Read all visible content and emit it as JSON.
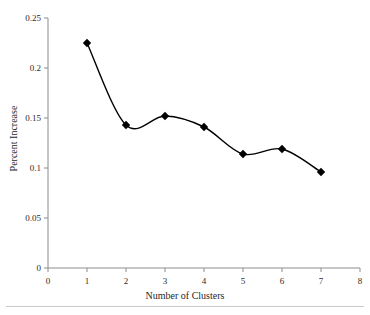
{
  "chart_data": {
    "type": "line",
    "title": "",
    "subtitle": "",
    "xlabel": "Number of Clusters",
    "ylabel": "Percent Increase",
    "x": [
      1,
      2,
      3,
      4,
      5,
      6,
      7
    ],
    "values": [
      0.225,
      0.143,
      0.152,
      0.141,
      0.114,
      0.119,
      0.096
    ],
    "series": [
      {
        "name": "Percent Increase",
        "values": [
          0.225,
          0.143,
          0.152,
          0.141,
          0.114,
          0.119,
          0.096
        ]
      }
    ],
    "xlim": [
      0,
      8
    ],
    "ylim": [
      0,
      0.25
    ],
    "xticks": [
      0,
      1,
      2,
      3,
      4,
      5,
      6,
      7,
      8
    ],
    "yticks": [
      0,
      0.05,
      0.1,
      0.15,
      0.2,
      0.25
    ],
    "xtick_labels": [
      "0",
      "1",
      "2",
      "3",
      "4",
      "5",
      "6",
      "7",
      "8"
    ],
    "ytick_labels": [
      "0",
      "0.05",
      "0.1",
      "0.15",
      "0.2",
      "0.25"
    ],
    "grid": false,
    "legend": false,
    "legend_position": "none",
    "smoothing": "spline",
    "marker": "diamond",
    "line_color": "#000000",
    "marker_color": "#000000",
    "axis_color": "#8c8c8c",
    "background_color": "#ffffff"
  }
}
